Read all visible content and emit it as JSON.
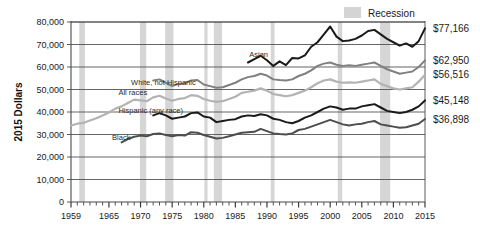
{
  "chart_data": {
    "type": "line",
    "title": "",
    "xlabel": "",
    "ylabel": "2015 Dollars",
    "ylim": [
      0,
      80000
    ],
    "xlim": [
      1959,
      2015
    ],
    "grid": true,
    "legend_position": "top-right",
    "y_ticks": [
      "0",
      "10,000",
      "20,000",
      "30,000",
      "40,000",
      "50,000",
      "60,000",
      "70,000",
      "80,000"
    ],
    "y_tick_values": [
      0,
      10000,
      20000,
      30000,
      40000,
      50000,
      60000,
      70000,
      80000
    ],
    "x_ticks": [
      "1959",
      "1965",
      "1970",
      "1975",
      "1980",
      "1985",
      "1990",
      "1995",
      "2000",
      "2005",
      "2010",
      "2015"
    ],
    "x_tick_values": [
      1959,
      1965,
      1970,
      1975,
      1980,
      1985,
      1990,
      1995,
      2000,
      2005,
      2010,
      2015
    ],
    "legend": [
      {
        "label": "Recession",
        "color": "#d4d4d4",
        "type": "band"
      }
    ],
    "recessions": [
      {
        "start": 1960.3,
        "end": 1961.2
      },
      {
        "start": 1969.9,
        "end": 1970.9
      },
      {
        "start": 1973.9,
        "end": 1975.2
      },
      {
        "start": 1980.1,
        "end": 1980.6
      },
      {
        "start": 1981.6,
        "end": 1982.9
      },
      {
        "start": 1990.6,
        "end": 1991.2
      },
      {
        "start": 2001.2,
        "end": 2001.9
      },
      {
        "start": 2007.9,
        "end": 2009.5
      }
    ],
    "series": [
      {
        "name": "Asian",
        "label": "Asian",
        "color": "#1a1a1a",
        "width": 2.0,
        "end_value": "$77,166",
        "end_value_number": 77166,
        "label_x": 1987.2,
        "label_y": 64500,
        "x": [
          1987,
          1988,
          1989,
          1990,
          1991,
          1992,
          1993,
          1994,
          1995,
          1996,
          1997,
          1998,
          1999,
          2000,
          2001,
          2002,
          2003,
          2004,
          2005,
          2006,
          2007,
          2008,
          2009,
          2010,
          2011,
          2012,
          2013,
          2014,
          2015
        ],
        "values": [
          62000,
          63500,
          65000,
          63000,
          60500,
          62500,
          60800,
          64000,
          63800,
          65200,
          69000,
          71000,
          74500,
          78000,
          73500,
          71500,
          71800,
          72500,
          74000,
          76000,
          76500,
          74500,
          72500,
          71000,
          69500,
          70500,
          69000,
          71500,
          77166
        ]
      },
      {
        "name": "White, not Hispanic",
        "label": "White, not Hispanic",
        "color": "#808080",
        "width": 2.0,
        "end_value": "$62,950",
        "end_value_number": 62950,
        "label_x": 1968.5,
        "label_y": 52000,
        "x": [
          1972,
          1973,
          1974,
          1975,
          1976,
          1977,
          1978,
          1979,
          1980,
          1981,
          1982,
          1983,
          1984,
          1985,
          1986,
          1987,
          1988,
          1989,
          1990,
          1991,
          1992,
          1993,
          1994,
          1995,
          1996,
          1997,
          1998,
          1999,
          2000,
          2001,
          2002,
          2003,
          2004,
          2005,
          2006,
          2007,
          2008,
          2009,
          2010,
          2011,
          2012,
          2013,
          2014,
          2015
        ],
        "values": [
          54000,
          54500,
          53000,
          51500,
          52500,
          52800,
          54000,
          54200,
          52200,
          51500,
          50800,
          51000,
          52000,
          53000,
          54500,
          55500,
          56000,
          57000,
          56200,
          54500,
          54200,
          54000,
          54500,
          56000,
          57000,
          58500,
          60500,
          61500,
          62000,
          61000,
          60500,
          60800,
          60500,
          61000,
          61500,
          62000,
          60500,
          59000,
          58000,
          57000,
          57500,
          58000,
          60000,
          62950
        ]
      },
      {
        "name": "All races",
        "label": "All races",
        "color": "#b3b3b3",
        "width": 2.2,
        "end_value": "$56,516",
        "end_value_number": 56516,
        "label_x": 1966.5,
        "label_y": 47500,
        "x": [
          1959,
          1960,
          1961,
          1962,
          1963,
          1964,
          1965,
          1966,
          1967,
          1968,
          1969,
          1970,
          1971,
          1972,
          1973,
          1974,
          1975,
          1976,
          1977,
          1978,
          1979,
          1980,
          1981,
          1982,
          1983,
          1984,
          1985,
          1986,
          1987,
          1988,
          1989,
          1990,
          1991,
          1992,
          1993,
          1994,
          1995,
          1996,
          1997,
          1998,
          1999,
          2000,
          2001,
          2002,
          2003,
          2004,
          2005,
          2006,
          2007,
          2008,
          2009,
          2010,
          2011,
          2012,
          2013,
          2014,
          2015
        ],
        "values": [
          34000,
          34800,
          35200,
          36200,
          37200,
          38500,
          39800,
          41500,
          42500,
          44000,
          45500,
          45200,
          44800,
          46500,
          47200,
          46000,
          45000,
          45800,
          46200,
          47500,
          47200,
          45800,
          45000,
          44500,
          44800,
          45800,
          46800,
          48500,
          49000,
          49500,
          50500,
          49500,
          48000,
          47500,
          47000,
          47500,
          48500,
          49500,
          51000,
          52800,
          54000,
          54500,
          53500,
          53000,
          53200,
          53000,
          53500,
          54000,
          54500,
          52500,
          51500,
          50500,
          50000,
          50500,
          51000,
          53500,
          56516
        ]
      },
      {
        "name": "Hispanic (any race)",
        "label": "Hispanic (any race)",
        "color": "#1a1a1a",
        "width": 2.0,
        "end_value": "$45,148",
        "end_value_number": 45148,
        "label_x": 1966.5,
        "label_y": 39500,
        "x": [
          1972,
          1973,
          1974,
          1975,
          1976,
          1977,
          1978,
          1979,
          1980,
          1981,
          1982,
          1983,
          1984,
          1985,
          1986,
          1987,
          1988,
          1989,
          1990,
          1991,
          1992,
          1993,
          1994,
          1995,
          1996,
          1997,
          1998,
          1999,
          2000,
          2001,
          2002,
          2003,
          2004,
          2005,
          2006,
          2007,
          2008,
          2009,
          2010,
          2011,
          2012,
          2013,
          2014,
          2015
        ],
        "values": [
          38500,
          39500,
          38500,
          37000,
          37500,
          38000,
          39500,
          39800,
          38000,
          37500,
          35500,
          36000,
          36500,
          36800,
          38000,
          38500,
          38200,
          39000,
          38500,
          37000,
          36500,
          35500,
          35000,
          36000,
          37500,
          38500,
          40000,
          41500,
          42500,
          42000,
          41000,
          41500,
          41500,
          42500,
          43000,
          43500,
          42000,
          40500,
          40000,
          39500,
          40000,
          41000,
          42500,
          45148
        ]
      },
      {
        "name": "Black",
        "label": "Black",
        "color": "#4d4d4d",
        "width": 2.0,
        "end_value": "$36,898",
        "end_value_number": 36898,
        "label_x": 1965.5,
        "label_y": 27500,
        "x": [
          1967,
          1968,
          1969,
          1970,
          1971,
          1972,
          1973,
          1974,
          1975,
          1976,
          1977,
          1978,
          1979,
          1980,
          1981,
          1982,
          1983,
          1984,
          1985,
          1986,
          1987,
          1988,
          1989,
          1990,
          1991,
          1992,
          1993,
          1994,
          1995,
          1996,
          1997,
          1998,
          1999,
          2000,
          2001,
          2002,
          2003,
          2004,
          2005,
          2006,
          2007,
          2008,
          2009,
          2010,
          2011,
          2012,
          2013,
          2014,
          2015
        ],
        "values": [
          26500,
          28000,
          29000,
          29500,
          29200,
          30200,
          30500,
          29800,
          29200,
          29800,
          29500,
          31000,
          30800,
          29800,
          29000,
          28200,
          28500,
          29200,
          30000,
          30800,
          31000,
          31200,
          32500,
          31500,
          30500,
          30200,
          30000,
          30500,
          32000,
          32500,
          33500,
          34500,
          35500,
          36500,
          35500,
          34500,
          34000,
          34500,
          34800,
          35500,
          36000,
          34500,
          34000,
          33500,
          33000,
          33200,
          34000,
          34800,
          36898
        ]
      }
    ]
  }
}
